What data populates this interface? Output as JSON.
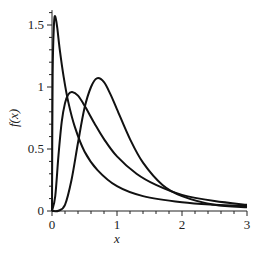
{
  "chart_data": {
    "type": "line",
    "title": "",
    "xlabel": "x",
    "ylabel": "f(x)",
    "xlim": [
      0,
      3
    ],
    "ylim": [
      0,
      1.6
    ],
    "grid": false,
    "legend": null,
    "x_ticks": [
      "0",
      "1",
      "2",
      "3"
    ],
    "y_ticks": [
      "0",
      "0.5",
      "1",
      "1.5"
    ],
    "series": [
      {
        "name": "curve-1",
        "x": [
          0,
          0.01,
          0.03,
          0.05,
          0.08,
          0.12,
          0.18,
          0.25,
          0.35,
          0.5,
          0.7,
          1.0,
          1.4,
          2.0,
          2.5,
          3.0
        ],
        "y": [
          0,
          1.1,
          1.5,
          1.57,
          1.48,
          1.3,
          1.08,
          0.88,
          0.68,
          0.48,
          0.33,
          0.2,
          0.12,
          0.07,
          0.05,
          0.04
        ]
      },
      {
        "name": "curve-2",
        "x": [
          0,
          0.05,
          0.1,
          0.15,
          0.2,
          0.25,
          0.31,
          0.4,
          0.5,
          0.65,
          0.8,
          1.0,
          1.3,
          1.6,
          2.0,
          2.5,
          3.0
        ],
        "y": [
          0,
          0.12,
          0.45,
          0.72,
          0.87,
          0.94,
          0.96,
          0.93,
          0.85,
          0.71,
          0.58,
          0.44,
          0.3,
          0.21,
          0.13,
          0.08,
          0.05
        ]
      },
      {
        "name": "curve-3",
        "x": [
          0,
          0.1,
          0.2,
          0.3,
          0.4,
          0.5,
          0.6,
          0.69,
          0.8,
          0.9,
          1.0,
          1.2,
          1.4,
          1.7,
          2.0,
          2.5,
          3.0
        ],
        "y": [
          0,
          0.002,
          0.05,
          0.25,
          0.55,
          0.83,
          1.0,
          1.07,
          1.04,
          0.94,
          0.82,
          0.58,
          0.39,
          0.21,
          0.12,
          0.05,
          0.03
        ]
      }
    ]
  }
}
